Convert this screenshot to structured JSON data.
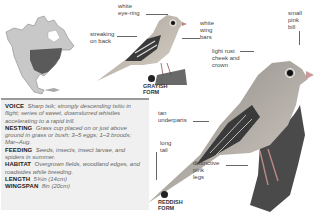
{
  "map": {
    "alt": "North America range map",
    "range_color": "#555555",
    "land_color": "#bdbdbd"
  },
  "labels": {
    "white_eye_ring": "white\neye-ring",
    "streaking_on_back": "streaking\non back",
    "white_wing_bars": "white\nwing\nbars",
    "small_pink_bill": "small\npink\nbill",
    "light_rust_cheek": "light rust\ncheek and\ncrown",
    "tan_underparts": "tan\nunderparts",
    "long_tail": "long\ntail",
    "distinctive_pink_legs": "distinctive\npink\nlegs"
  },
  "forms": {
    "grayish": "GRAYISH\nFORM",
    "reddish": "REDDISH\nFORM"
  },
  "info": [
    {
      "key": "VOICE",
      "value": "Sharp tsik; strongly descending tsiiiu in flight; series of sweet, downslurred whistles accelerating to a rapid trill."
    },
    {
      "key": "NESTING",
      "value": "Grass cup placed on or just above ground in grass or bush; 3–5 eggs; 1–3 broods; Mar–Aug."
    },
    {
      "key": "FEEDING",
      "value": "Seeds, insects, insect larvae, and spiders in summer."
    },
    {
      "key": "HABITAT",
      "value": "Overgrown fields, woodland edges, and roadsides while breeding."
    },
    {
      "key": "LENGTH",
      "value": "5¾in (14cm)"
    },
    {
      "key": "WINGSPAN",
      "value": "8in (20cm)"
    }
  ],
  "colors": {
    "box_bg": "#f0f0f0",
    "box_rule": "#9a9a9a"
  }
}
